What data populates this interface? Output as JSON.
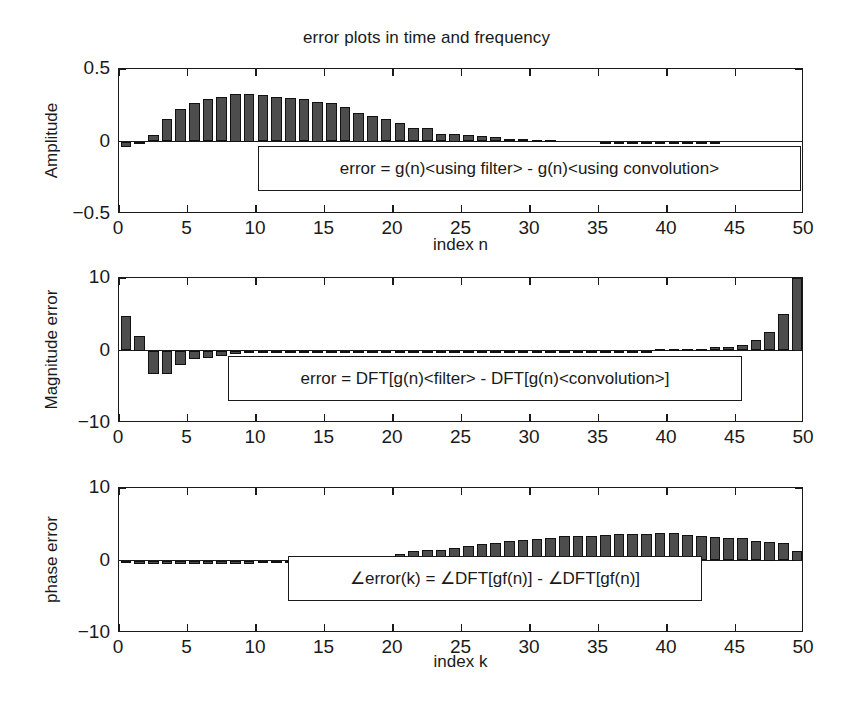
{
  "figure": {
    "title": "error plots in time and frequency",
    "background": "#ffffff",
    "bar_fill": "#4d4d4d",
    "bar_edge": "#111111",
    "axis_color": "#1a1a1a"
  },
  "panels": [
    {
      "id": "amplitude-error",
      "ylabel": "Amplitude",
      "xlabel": "index n",
      "annotation": "error = g(n)<using filter> - g(n)<using convolution>",
      "yticklabels": [
        "0.5",
        "0",
        "-0.5"
      ],
      "xticklabels": [
        "0",
        "5",
        "10",
        "15",
        "20",
        "25",
        "30",
        "35",
        "40",
        "45",
        "50"
      ]
    },
    {
      "id": "magnitude-error",
      "ylabel": "Magnitude error",
      "xlabel": "",
      "annotation": "error = DFT[g(n)<filter> - DFT[g(n)<convolution>]",
      "yticklabels": [
        "10",
        "0",
        "-10"
      ],
      "xticklabels": [
        "0",
        "5",
        "10",
        "15",
        "20",
        "25",
        "30",
        "35",
        "40",
        "45",
        "50"
      ]
    },
    {
      "id": "phase-error",
      "ylabel": "phase error",
      "xlabel": "index k",
      "annotation": "∠error(k) = ∠DFT[gf(n)] - ∠DFT[gf(n)]",
      "yticklabels": [
        "10",
        "0",
        "-10"
      ],
      "xticklabels": [
        "0",
        "5",
        "10",
        "15",
        "20",
        "25",
        "30",
        "35",
        "40",
        "45",
        "50"
      ]
    }
  ],
  "chart_data": [
    {
      "type": "bar",
      "id": "amplitude-error",
      "title": "error plots in time and frequency",
      "xlabel": "index n",
      "ylabel": "Amplitude",
      "xlim": [
        0,
        50
      ],
      "ylim": [
        -0.5,
        0.5
      ],
      "yticks": [
        -0.5,
        0,
        0.5
      ],
      "xticks": [
        0,
        5,
        10,
        15,
        20,
        25,
        30,
        35,
        40,
        45,
        50
      ],
      "grid": false,
      "legend": "none",
      "annotation": "error = g(n)<using filter> - g(n)<using convolution>",
      "x": [
        0,
        1,
        2,
        3,
        4,
        5,
        6,
        7,
        8,
        9,
        10,
        11,
        12,
        13,
        14,
        15,
        16,
        17,
        18,
        19,
        20,
        21,
        22,
        23,
        24,
        25,
        26,
        27,
        28,
        29,
        30,
        31,
        32,
        33,
        34,
        35,
        36,
        37,
        38,
        39,
        40,
        41,
        42,
        43,
        44,
        45,
        46,
        47,
        48,
        49
      ],
      "values": [
        -0.035,
        -0.012,
        0.045,
        0.155,
        0.225,
        0.265,
        0.295,
        0.305,
        0.325,
        0.325,
        0.32,
        0.305,
        0.3,
        0.295,
        0.275,
        0.265,
        0.235,
        0.2,
        0.175,
        0.155,
        0.13,
        0.095,
        0.09,
        0.055,
        0.05,
        0.045,
        0.035,
        0.03,
        0.018,
        0.015,
        0.01,
        0.008,
        0.0,
        0.0,
        0.0,
        -0.012,
        -0.012,
        -0.012,
        -0.012,
        -0.012,
        -0.012,
        -0.012,
        -0.012,
        -0.012,
        0.0,
        0.0,
        0.0,
        0.0,
        0.0,
        0.0
      ]
    },
    {
      "type": "bar",
      "id": "magnitude-error",
      "title": "",
      "xlabel": "",
      "ylabel": "Magnitude error",
      "xlim": [
        0,
        50
      ],
      "ylim": [
        -10,
        10
      ],
      "yticks": [
        -10,
        0,
        10
      ],
      "xticks": [
        0,
        5,
        10,
        15,
        20,
        25,
        30,
        35,
        40,
        45,
        50
      ],
      "grid": false,
      "legend": "none",
      "annotation": "error = DFT[g(n)<filter> - DFT[g(n)<convolution>]",
      "x": [
        0,
        1,
        2,
        3,
        4,
        5,
        6,
        7,
        8,
        9,
        10,
        11,
        12,
        13,
        14,
        15,
        16,
        17,
        18,
        19,
        20,
        21,
        22,
        23,
        24,
        25,
        26,
        27,
        28,
        29,
        30,
        31,
        32,
        33,
        34,
        35,
        36,
        37,
        38,
        39,
        40,
        41,
        42,
        43,
        44,
        45,
        46,
        47,
        48,
        49
      ],
      "values": [
        4.7,
        2.0,
        -3.3,
        -3.2,
        -2.0,
        -1.2,
        -1.1,
        -0.8,
        -0.5,
        -0.4,
        -0.35,
        -0.3,
        -0.3,
        -0.3,
        -0.3,
        -0.3,
        -0.3,
        -0.3,
        -0.3,
        -0.3,
        -0.3,
        -0.3,
        -0.3,
        -0.15,
        -0.1,
        -0.1,
        -0.1,
        -0.1,
        -0.1,
        -0.1,
        -0.1,
        -0.1,
        -0.1,
        -0.1,
        -0.1,
        -0.1,
        -0.1,
        -0.1,
        -0.1,
        0.2,
        0.2,
        0.2,
        0.25,
        0.45,
        0.55,
        0.7,
        1.4,
        2.6,
        5.1,
        10.0
      ]
    },
    {
      "type": "bar",
      "id": "phase-error",
      "title": "",
      "xlabel": "index k",
      "ylabel": "phase error",
      "xlim": [
        0,
        50
      ],
      "ylim": [
        -10,
        10
      ],
      "yticks": [
        -10,
        0,
        10
      ],
      "xticks": [
        0,
        5,
        10,
        15,
        20,
        25,
        30,
        35,
        40,
        45,
        50
      ],
      "grid": false,
      "legend": "none",
      "annotation": "∠error(k) = ∠DFT[gf(n)] - ∠DFT[gf(n)]",
      "x": [
        0,
        1,
        2,
        3,
        4,
        5,
        6,
        7,
        8,
        9,
        10,
        11,
        12,
        13,
        14,
        15,
        16,
        17,
        18,
        19,
        20,
        21,
        22,
        23,
        24,
        25,
        26,
        27,
        28,
        29,
        30,
        31,
        32,
        33,
        34,
        35,
        36,
        37,
        38,
        39,
        40,
        41,
        42,
        43,
        44,
        45,
        46,
        47,
        48,
        49
      ],
      "values": [
        -0.35,
        -0.55,
        -0.5,
        -0.45,
        -0.45,
        -0.45,
        -0.45,
        -0.45,
        -0.45,
        -0.45,
        -0.4,
        -0.4,
        -0.4,
        -0.4,
        -0.35,
        -0.2,
        0.0,
        0.35,
        0.55,
        0.6,
        0.95,
        1.3,
        1.4,
        1.45,
        1.75,
        2.05,
        2.25,
        2.45,
        2.65,
        2.8,
        2.95,
        3.15,
        3.35,
        3.35,
        3.4,
        3.55,
        3.7,
        3.7,
        3.7,
        3.75,
        3.75,
        3.55,
        3.4,
        3.2,
        3.05,
        3.05,
        2.65,
        2.5,
        2.35,
        1.25
      ]
    }
  ]
}
